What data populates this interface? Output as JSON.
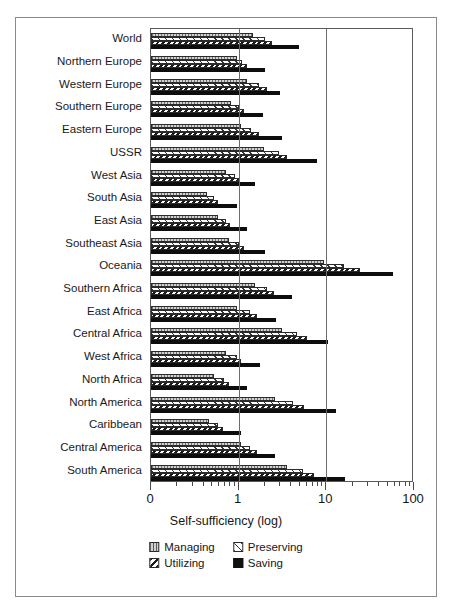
{
  "chart_data": {
    "type": "bar",
    "orientation": "horizontal",
    "title": "",
    "xlabel": "Self-sufficiency (log)",
    "ylabel": "",
    "xscale": "log",
    "xlim": [
      0.1,
      100
    ],
    "xticks": [
      0.1,
      1,
      10,
      100
    ],
    "xtick_labels": [
      "0",
      "1",
      "10",
      "100"
    ],
    "grid": true,
    "grid_axis": "x",
    "legend_position": "bottom",
    "categories": [
      "World",
      "Northern Europe",
      "Western Europe",
      "Southern Europe",
      "Eastern Europe",
      "USSR",
      "West Asia",
      "South Asia",
      "East Asia",
      "Southeast Asia",
      "Oceania",
      "Southern Africa",
      "East Africa",
      "Central Africa",
      "West Africa",
      "North Africa",
      "North America",
      "Caribbean",
      "Central America",
      "South America"
    ],
    "series": [
      {
        "name": "Managing",
        "pattern": "vertical-lines",
        "values": [
          1.45,
          0.95,
          1.25,
          0.82,
          1.05,
          1.95,
          0.72,
          0.43,
          0.58,
          0.78,
          9.5,
          1.55,
          0.95,
          3.1,
          0.72,
          0.52,
          2.6,
          0.46,
          1.05,
          3.6
        ]
      },
      {
        "name": "Preserving",
        "pattern": "backslash-hatch",
        "values": [
          2.0,
          1.1,
          1.7,
          1.0,
          1.4,
          2.9,
          0.9,
          0.52,
          0.72,
          1.0,
          16.0,
          2.1,
          1.35,
          4.6,
          0.95,
          0.68,
          4.2,
          0.58,
          1.35,
          5.4
        ]
      },
      {
        "name": "Utilizing",
        "pattern": "forward-hatch",
        "values": [
          2.4,
          1.25,
          2.1,
          1.15,
          1.7,
          3.6,
          1.0,
          0.58,
          0.8,
          1.15,
          24.0,
          2.5,
          1.6,
          6.0,
          1.05,
          0.78,
          5.6,
          0.66,
          1.6,
          7.2
        ]
      },
      {
        "name": "Saving",
        "pattern": "solid-black",
        "values": [
          4.9,
          2.0,
          3.0,
          1.9,
          3.1,
          7.8,
          1.55,
          0.95,
          1.25,
          2.0,
          58.0,
          4.1,
          2.7,
          10.5,
          1.75,
          1.25,
          13.0,
          1.05,
          2.6,
          16.5
        ]
      }
    ]
  },
  "axis": {
    "title": "Self-sufficiency (log)",
    "tick_labels": [
      "0",
      "1",
      "10",
      "100"
    ]
  },
  "legend": {
    "items": [
      {
        "label": "Managing",
        "swatch": "managing-swatch-icon"
      },
      {
        "label": "Preserving",
        "swatch": "preserving-swatch-icon"
      },
      {
        "label": "Utilizing",
        "swatch": "utilizing-swatch-icon"
      },
      {
        "label": "Saving",
        "swatch": "saving-swatch-icon"
      }
    ]
  }
}
